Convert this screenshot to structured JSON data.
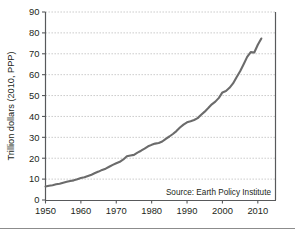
{
  "figure": {
    "title": "",
    "source_note": "Source: Earth Policy Institute",
    "y_axis_title": "Trillion dollars (2010, PPP)",
    "x_axis_title": "",
    "line_color": "#6b6b6b",
    "grid_color": "#bfbfbf",
    "axis_color": "#58595b",
    "text_color": "#231f20",
    "background_color": "#ffffff",
    "footer_rule_color": "#8c8c8c"
  },
  "chart_data": {
    "type": "line",
    "title": "",
    "subtitle": "",
    "xlabel": "",
    "ylabel": "Trillion dollars (2010, PPP)",
    "xlim": [
      1950,
      2015
    ],
    "ylim": [
      0,
      90
    ],
    "grid": true,
    "grid_axis": "y",
    "legend": false,
    "legend_position": "none",
    "annotations": [
      {
        "text": "Source: Earth Policy Institute",
        "x": 2010,
        "y": 5,
        "align": "right"
      }
    ],
    "x_ticks": [
      1950,
      1960,
      1970,
      1980,
      1990,
      2000,
      2010
    ],
    "x_tick_labels": [
      "1950",
      "1960",
      "1970",
      "1980",
      "1990",
      "2000",
      "2010"
    ],
    "y_ticks": [
      0,
      10,
      20,
      30,
      40,
      50,
      60,
      70,
      80,
      90
    ],
    "y_tick_labels": [
      "0",
      "10",
      "20",
      "30",
      "40",
      "50",
      "60",
      "70",
      "80",
      "90"
    ],
    "series": [
      {
        "name": "Gross World Product",
        "color": "#6b6b6b",
        "x": [
          1950,
          1951,
          1952,
          1953,
          1954,
          1955,
          1956,
          1957,
          1958,
          1959,
          1960,
          1961,
          1962,
          1963,
          1964,
          1965,
          1966,
          1967,
          1968,
          1969,
          1970,
          1971,
          1972,
          1973,
          1974,
          1975,
          1976,
          1977,
          1978,
          1979,
          1980,
          1981,
          1982,
          1983,
          1984,
          1985,
          1986,
          1987,
          1988,
          1989,
          1990,
          1991,
          1992,
          1993,
          1994,
          1995,
          1996,
          1997,
          1998,
          1999,
          2000,
          2001,
          2002,
          2003,
          2004,
          2005,
          2006,
          2007,
          2008,
          2009,
          2010,
          2011
        ],
        "values": [
          6.5,
          6.8,
          7.1,
          7.5,
          7.8,
          8.3,
          8.7,
          9.1,
          9.4,
          9.9,
          10.5,
          10.9,
          11.5,
          12.1,
          12.9,
          13.6,
          14.4,
          15.0,
          15.9,
          16.8,
          17.6,
          18.3,
          19.4,
          20.9,
          21.3,
          21.6,
          22.7,
          23.6,
          24.6,
          25.7,
          26.4,
          27.0,
          27.3,
          28.0,
          29.3,
          30.4,
          31.6,
          33.0,
          34.7,
          36.1,
          37.2,
          37.7,
          38.3,
          39.2,
          40.8,
          42.3,
          44.0,
          45.8,
          47.1,
          48.9,
          51.5,
          52.2,
          53.7,
          55.8,
          58.8,
          61.6,
          65.0,
          68.5,
          70.8,
          70.6,
          74.3,
          77.3
        ]
      }
    ]
  }
}
